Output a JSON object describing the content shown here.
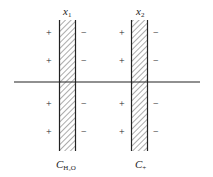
{
  "diagram": {
    "membranes": [
      {
        "top_label": "x",
        "top_label_sub": "1",
        "bottom_label": "C",
        "bottom_label_sub": "H₂O",
        "left_signs": [
          "+",
          "+",
          "+",
          "+"
        ],
        "right_signs": [
          "−",
          "−",
          "−",
          "−"
        ]
      },
      {
        "top_label": "x",
        "top_label_sub": "2",
        "bottom_label": "C",
        "bottom_label_sub": "+",
        "left_signs": [
          "+",
          "+",
          "+",
          "+"
        ],
        "right_signs": [
          "−",
          "−",
          "−",
          "−"
        ]
      }
    ],
    "colors": {
      "stroke": "#222222",
      "background": "#ffffff"
    }
  }
}
